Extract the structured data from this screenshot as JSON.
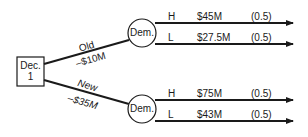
{
  "diagram": {
    "type": "decision-tree",
    "decision_node": {
      "label_line1": "Dec.",
      "label_line2": "1"
    },
    "chance_nodes": [
      {
        "label": "Dem."
      },
      {
        "label": "Dem."
      }
    ],
    "branches": [
      {
        "name": "Old",
        "cost": "–$10M",
        "outcomes": [
          {
            "state": "H",
            "value": "$45M",
            "probability": "(0.5)"
          },
          {
            "state": "L",
            "value": "$27.5M",
            "probability": "(0.5)"
          }
        ]
      },
      {
        "name": "New",
        "cost": "–$35M",
        "outcomes": [
          {
            "state": "H",
            "value": "$75M",
            "probability": "(0.5)"
          },
          {
            "state": "L",
            "value": "$43M",
            "probability": "(0.5)"
          }
        ]
      }
    ],
    "colors": {
      "line": "#1a1a1a",
      "background": "#ffffff"
    }
  }
}
